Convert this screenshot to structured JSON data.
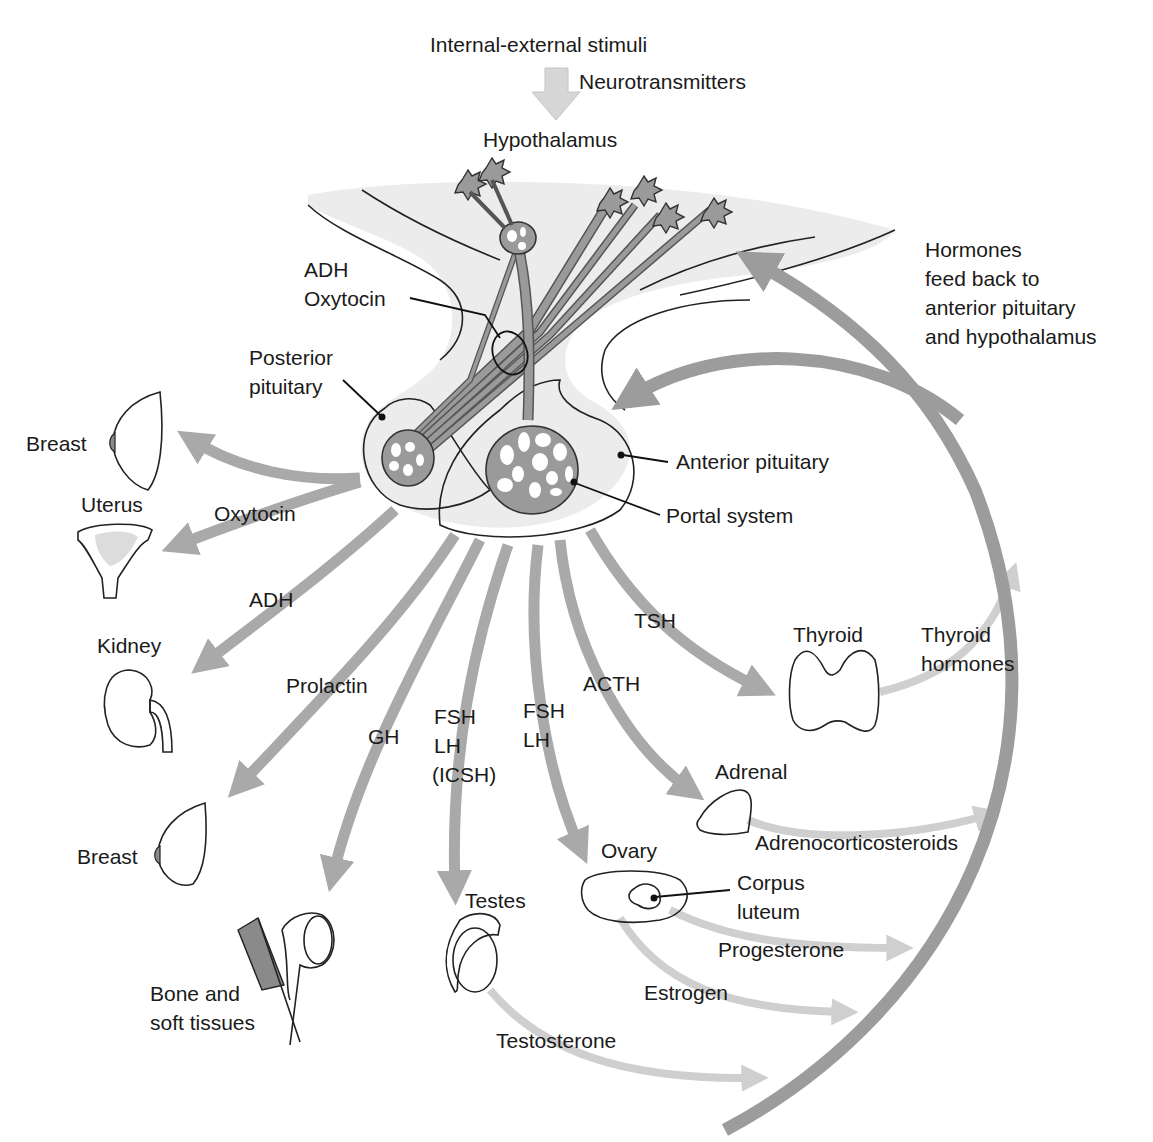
{
  "colors": {
    "background": "#ffffff",
    "text": "#1a1a1a",
    "tissue_fill": "#ececec",
    "neuron_fill": "#9a9a9a",
    "hormone_arrow": "#a9a9a9",
    "feedback_arrow": "#9c9c9c",
    "target_hormone_arrow": "#cfcfcf",
    "stimulus_arrow": "#d6d6d6",
    "organ_fill": "#e8e8e8",
    "organ_dark": "#8a8a8a"
  },
  "top": {
    "stimuli": "Internal-external stimuli",
    "neurotransmitters": "Neurotransmitters",
    "hypothalamus": "Hypothalamus"
  },
  "feedback": {
    "lines": [
      "Hormones",
      "feed back to",
      "anterior pituitary",
      "and hypothalamus"
    ]
  },
  "pituitary": {
    "adh": "ADH",
    "oxytocin": "Oxytocin",
    "posterior_line1": "Posterior",
    "posterior_line2": "pituitary",
    "anterior": "Anterior pituitary",
    "portal": "Portal system"
  },
  "hormones": {
    "oxytocin": "Oxytocin",
    "adh": "ADH",
    "prolactin": "Prolactin",
    "gh": "GH",
    "fsh_lh_male": [
      "FSH",
      "LH",
      "(ICSH)"
    ],
    "fsh_lh_female": [
      "FSH",
      "LH"
    ],
    "acth": "ACTH",
    "tsh": "TSH"
  },
  "targets": {
    "breast_top": "Breast",
    "uterus": "Uterus",
    "kidney": "Kidney",
    "breast_bottom": "Breast",
    "bone_line1": "Bone and",
    "bone_line2": "soft tissues",
    "testes": "Testes",
    "ovary": "Ovary",
    "corpus_line1": "Corpus",
    "corpus_line2": "luteum",
    "adrenal": "Adrenal",
    "thyroid": "Thyroid"
  },
  "target_hormones": {
    "thyroid_line1": "Thyroid",
    "thyroid_line2": "hormones",
    "adrenocorticosteroids": "Adrenocorticosteroids",
    "progesterone": "Progesterone",
    "estrogen": "Estrogen",
    "testosterone": "Testosterone"
  }
}
